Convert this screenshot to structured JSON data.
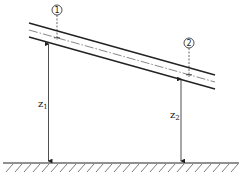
{
  "diagram": {
    "sections": [
      {
        "id": "section-1",
        "marker": "1",
        "label": "z",
        "subscript": "1"
      },
      {
        "id": "section-2",
        "marker": "2",
        "label": "z",
        "subscript": "2"
      }
    ],
    "colors": {
      "stroke": "#222222",
      "background": "#ffffff"
    }
  }
}
